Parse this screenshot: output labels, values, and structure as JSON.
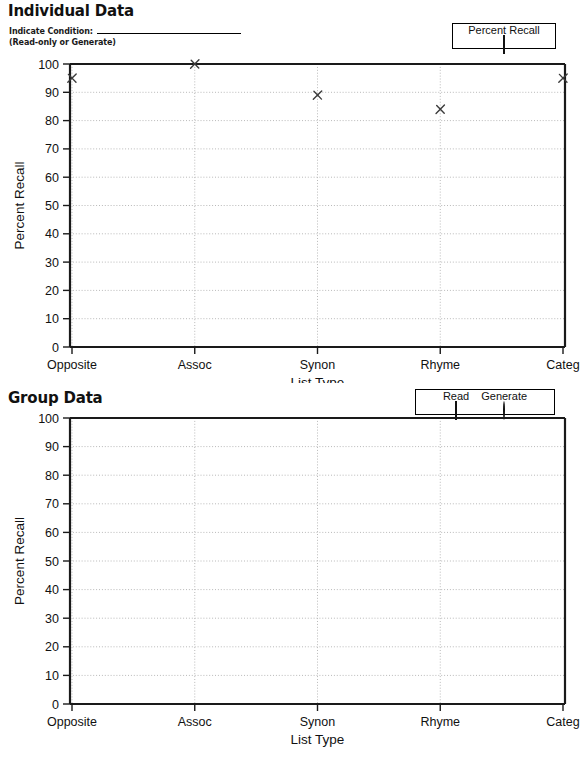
{
  "document": {
    "panels": [
      {
        "id": "individual",
        "title": "Individual Data",
        "instruction_label": "Indicate Condition:",
        "instruction_sub": "(Read-only or Generate)",
        "blank_line_value": ""
      },
      {
        "id": "group",
        "title": "Group Data"
      }
    ]
  },
  "legends": {
    "individual": {
      "entries": [
        {
          "label": "Percent Recall",
          "marker": "square"
        }
      ]
    },
    "group": {
      "entries": [
        {
          "label": "Read",
          "marker": "square"
        },
        {
          "label": "Generate",
          "marker": "circle"
        }
      ]
    }
  },
  "chart_data": [
    {
      "type": "scatter",
      "id": "individual-data",
      "title": "Individual Data",
      "xlabel": "List Type",
      "ylabel": "Percent Recall",
      "categories": [
        "Opposite",
        "Assoc",
        "Synon",
        "Rhyme",
        "Categ"
      ],
      "yticks": [
        0,
        10,
        20,
        30,
        40,
        50,
        60,
        70,
        80,
        90,
        100
      ],
      "ylim": [
        0,
        100
      ],
      "grid": true,
      "legend_position": "top-right",
      "marker_style": "x",
      "series": [
        {
          "name": "Percent Recall",
          "values": [
            95,
            100,
            89,
            84,
            95
          ]
        }
      ]
    },
    {
      "type": "scatter",
      "id": "group-data",
      "title": "Group Data",
      "xlabel": "List Type",
      "ylabel": "Percent Recall",
      "categories": [
        "Opposite",
        "Assoc",
        "Synon",
        "Rhyme",
        "Categ"
      ],
      "yticks": [
        0,
        10,
        20,
        30,
        40,
        50,
        60,
        70,
        80,
        90,
        100
      ],
      "ylim": [
        0,
        100
      ],
      "grid": true,
      "legend_position": "top-right",
      "series": [
        {
          "name": "Read",
          "values": []
        },
        {
          "name": "Generate",
          "values": []
        }
      ]
    }
  ]
}
